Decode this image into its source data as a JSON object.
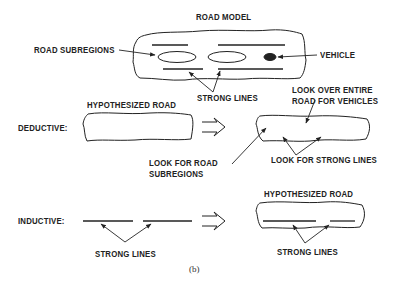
{
  "figure": {
    "title": "ROAD MODEL",
    "caption": "(b)",
    "colors": {
      "ink": "#222222",
      "background": "#ffffff"
    }
  },
  "road_model": {
    "labels": {
      "subregions": "ROAD SUBREGIONS",
      "vehicle": "VEHICLE",
      "strong_lines": "STRONG LINES"
    }
  },
  "deductive": {
    "row_label": "DEDUCTIVE:",
    "input_label": "HYPOTHESIZED ROAD",
    "arrow_icon": "double-right-arrow",
    "annotations": {
      "look_vehicles_line1": "LOOK OVER ENTIRE",
      "look_vehicles_line2": "ROAD FOR VEHICLES",
      "look_subregions_line1": "LOOK FOR ROAD",
      "look_subregions_line2": "SUBREGIONS",
      "look_strong_lines": "LOOK FOR STRONG LINES"
    }
  },
  "inductive": {
    "row_label": "INDUCTIVE:",
    "input_label": "STRONG LINES",
    "arrow_icon": "double-right-arrow",
    "output_title": "HYPOTHESIZED ROAD",
    "output_label": "STRONG LINES"
  }
}
